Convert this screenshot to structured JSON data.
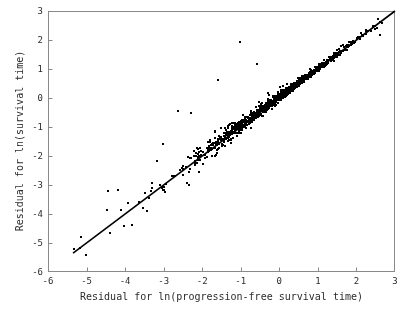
{
  "chart_data": {
    "type": "scatter",
    "title": "",
    "xlabel": "Residual for ln(progression-free survival time)",
    "ylabel": "Residual for ln(survival time)",
    "xlim": [
      -6,
      3
    ],
    "ylim": [
      -6,
      3
    ],
    "xticks": [
      -6,
      -5,
      -4,
      -3,
      -2,
      -1,
      0,
      1,
      2,
      3
    ],
    "yticks": [
      -6,
      -5,
      -4,
      -3,
      -2,
      -1,
      0,
      1,
      2,
      3
    ],
    "xtick_labels": [
      "-6",
      "-5",
      "-4",
      "-3",
      "-2",
      "-1",
      "0",
      "1",
      "2",
      "3"
    ],
    "ytick_labels": [
      "-6",
      "-5",
      "-4",
      "-3",
      "-2",
      "-1",
      "0",
      "1",
      "2",
      "3"
    ],
    "grid": false,
    "legend": null,
    "marker": {
      "shape": "square",
      "size_px": 2,
      "color": "#000000"
    },
    "reference_line": {
      "kind": "identity",
      "label": "y = x",
      "color": "#000000",
      "width_px": 1.6,
      "x_start": -5.35,
      "y_start": -5.35,
      "x_end": 3.0,
      "y_end": 3.0
    },
    "n_points": 1020,
    "point_cloud_model": {
      "x_distribution": "skewed-normal",
      "x_mean": 0.15,
      "x_sd": 1.0,
      "x_min": -5.35,
      "x_max": 2.7,
      "residual_sd_at_high_x": 0.055,
      "residual_sd_at_low_x": 0.52,
      "upward_skew": 0.62,
      "seed": 20240617
    },
    "notable_outliers": [
      {
        "x": -4.18,
        "y": -3.18
      },
      {
        "x": -5.02,
        "y": -5.42
      },
      {
        "x": -5.32,
        "y": -5.22
      },
      {
        "x": -1.02,
        "y": 1.92
      },
      {
        "x": -2.62,
        "y": -0.46
      },
      {
        "x": -2.28,
        "y": -0.52
      },
      {
        "x": -1.58,
        "y": 0.62
      },
      {
        "x": -0.58,
        "y": 1.18
      },
      {
        "x": -3.02,
        "y": -1.58
      },
      {
        "x": 2.62,
        "y": 2.18
      }
    ]
  }
}
